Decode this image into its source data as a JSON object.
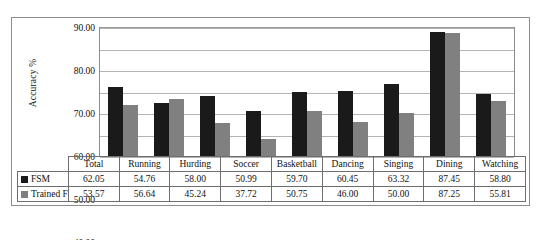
{
  "chart_data": {
    "type": "bar",
    "title": "",
    "xlabel": "",
    "ylabel": "Accuracy %",
    "ylim": [
      30.0,
      90.0
    ],
    "ytick_labels": [
      "90.00",
      "80.00",
      "70.00",
      "60.00",
      "50.00",
      "40.00",
      "30.00"
    ],
    "ytick_values": [
      90.0,
      80.0,
      70.0,
      60.0,
      50.0,
      40.0,
      30.0
    ],
    "grid": true,
    "legend_position": "data-table-left",
    "categories": [
      "Total",
      "Running",
      "Hurding",
      "Soccer",
      "Basketball",
      "Dancing",
      "Singing",
      "Dining",
      "Watching"
    ],
    "series": [
      {
        "name": "FSM",
        "color": "#1a1a1a",
        "values": [
          62.05,
          54.76,
          58.0,
          50.99,
          59.7,
          60.45,
          63.32,
          87.45,
          58.8
        ],
        "value_labels": [
          "62.05",
          "54.76",
          "58.00",
          "50.99",
          "59.70",
          "60.45",
          "63.32",
          "87.45",
          "58.80"
        ]
      },
      {
        "name": "Trained FRBM",
        "color": "#808080",
        "values": [
          53.57,
          56.64,
          45.24,
          37.72,
          50.75,
          46.0,
          50.0,
          87.25,
          55.81
        ],
        "value_labels": [
          "53.57",
          "56.64",
          "45.24",
          "37.72",
          "50.75",
          "46.00",
          "50.00",
          "87.25",
          "55.81"
        ]
      }
    ]
  }
}
